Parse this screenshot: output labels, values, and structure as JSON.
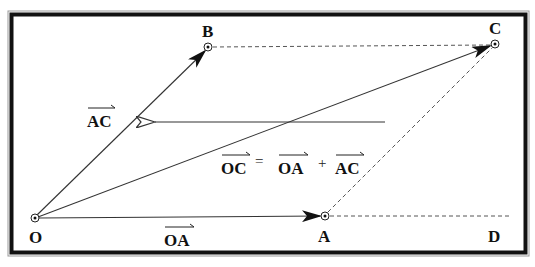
{
  "diagram": {
    "points": {
      "O": {
        "label": "O",
        "x": 35,
        "y": 218
      },
      "A": {
        "label": "A",
        "x": 325,
        "y": 216
      },
      "B": {
        "label": "B",
        "x": 208,
        "y": 47
      },
      "C": {
        "label": "C",
        "x": 495,
        "y": 44
      },
      "D": {
        "label": "D"
      }
    },
    "vectors": {
      "oa": {
        "label": "OA"
      },
      "ac": {
        "label": "AC"
      },
      "oc": {
        "label": "OC"
      }
    },
    "equation": {
      "lhs": "OC",
      "equals": "=",
      "term1": "OA",
      "plus": "+",
      "term2": "AC"
    },
    "colors": {
      "frame": "#111111",
      "frame_outer": "#888888",
      "line": "#333333",
      "dashed": "#555555",
      "background": "#ffffff"
    }
  }
}
